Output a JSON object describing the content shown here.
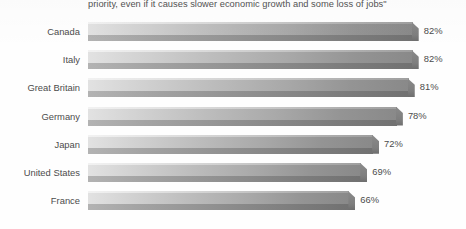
{
  "chart_data": {
    "type": "bar",
    "orientation": "horizontal",
    "title": "priority,  even if it causes slower economic growth and some loss of jobs\"",
    "xlabel": "",
    "ylabel": "",
    "xlim": [
      0,
      100
    ],
    "grid": false,
    "legend": null,
    "value_suffix": "%",
    "categories": [
      "Canada",
      "Italy",
      "Great Britain",
      "Germany",
      "Japan",
      "United States",
      "France"
    ],
    "values": [
      82,
      82,
      81,
      78,
      72,
      69,
      66
    ],
    "value_labels": [
      "82%",
      "82%",
      "81%",
      "78%",
      "72%",
      "69%",
      "66%"
    ],
    "colors": {
      "bar_gradient_start": "#e2e2e2",
      "bar_gradient_end": "#898989",
      "bar_base": "#7c7c7c",
      "text": "#4c4c4c",
      "background": "#fefefe"
    }
  }
}
